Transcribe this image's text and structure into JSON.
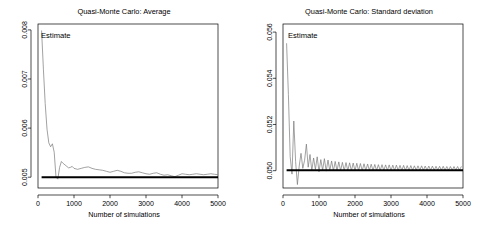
{
  "figure": {
    "background": "#ffffff",
    "series_color": "#7a7a7a",
    "reference_color": "#000000"
  },
  "panels": [
    {
      "key": "average",
      "title": "Quasi-Monte Carlo: Average",
      "annotation": "Estimate",
      "xlabel": "Number of simulations",
      "ylabel": "",
      "xticks": [
        "0",
        "1000",
        "2000",
        "3000",
        "4000",
        "5000"
      ],
      "yticks": [
        "0.005",
        "0.006",
        "0.007",
        "0.008"
      ]
    },
    {
      "key": "stdev",
      "title": "Quasi-Monte Carlo: Standard deviation",
      "annotation": "Estimate",
      "xlabel": "Number of simulations",
      "ylabel": "",
      "xticks": [
        "0",
        "1000",
        "2000",
        "3000",
        "4000",
        "5000"
      ],
      "yticks": [
        "0.050",
        "0.052",
        "0.054",
        "0.056"
      ]
    }
  ],
  "chart_data": [
    {
      "type": "line",
      "title": "Quasi-Monte Carlo: Average",
      "xlabel": "Number of simulations",
      "ylabel": "",
      "xlim": [
        0,
        5000
      ],
      "ylim": [
        0.00478,
        0.00812
      ],
      "xticks": [
        0,
        1000,
        2000,
        3000,
        4000,
        5000
      ],
      "yticks": [
        0.005,
        0.006,
        0.007,
        0.008
      ],
      "grid": false,
      "legend": false,
      "annotations": [
        {
          "text": "Estimate",
          "x": 180,
          "y": 0.00795,
          "color": "#000000"
        }
      ],
      "series": [
        {
          "name": "Estimate",
          "color": "#7a7a7a",
          "width": 0.7,
          "x": [
            100,
            150,
            200,
            250,
            300,
            350,
            400,
            450,
            500,
            550,
            600,
            650,
            700,
            750,
            800,
            850,
            900,
            950,
            1000,
            1100,
            1200,
            1300,
            1400,
            1500,
            1600,
            1700,
            1800,
            1900,
            2000,
            2100,
            2200,
            2300,
            2400,
            2500,
            2600,
            2700,
            2800,
            2900,
            3000,
            3100,
            3200,
            3300,
            3400,
            3500,
            3600,
            3700,
            3800,
            3900,
            4000,
            4100,
            4200,
            4300,
            4400,
            4500,
            4600,
            4700,
            4800,
            4900,
            5000
          ],
          "y": [
            0.00798,
            0.0072,
            0.0065,
            0.00598,
            0.0057,
            0.00562,
            0.00568,
            0.00551,
            0.005,
            0.00496,
            0.0052,
            0.00532,
            0.00528,
            0.00525,
            0.00522,
            0.00519,
            0.0052,
            0.00522,
            0.00518,
            0.00516,
            0.00518,
            0.0052,
            0.00521,
            0.00518,
            0.00516,
            0.00515,
            0.00514,
            0.00512,
            0.0051,
            0.00512,
            0.00514,
            0.00512,
            0.00509,
            0.00508,
            0.00508,
            0.0051,
            0.00511,
            0.00509,
            0.00507,
            0.00506,
            0.00508,
            0.00509,
            0.00506,
            0.00504,
            0.00505,
            0.00503,
            0.00501,
            0.00504,
            0.00507,
            0.00506,
            0.00505,
            0.00506,
            0.00507,
            0.00506,
            0.00505,
            0.00506,
            0.00507,
            0.00506,
            0.00505
          ]
        },
        {
          "name": "Reference",
          "color": "#000000",
          "width": 2.1,
          "x": [
            100,
            5000
          ],
          "y": [
            0.005,
            0.005
          ]
        }
      ]
    },
    {
      "type": "line",
      "title": "Quasi-Monte Carlo: Standard deviation",
      "xlabel": "Number of simulations",
      "ylabel": "",
      "xlim": [
        0,
        5000
      ],
      "ylim": [
        0.04925,
        0.05635
      ],
      "xticks": [
        0,
        1000,
        2000,
        3000,
        4000,
        5000
      ],
      "yticks": [
        0.05,
        0.052,
        0.054,
        0.056
      ],
      "grid": false,
      "legend": false,
      "annotations": [
        {
          "text": "Estimate",
          "x": 180,
          "y": 0.05585,
          "color": "#000000"
        }
      ],
      "series": [
        {
          "name": "Estimate",
          "color": "#7a7a7a",
          "width": 0.7,
          "x": [
            100,
            150,
            200,
            250,
            300,
            350,
            400,
            450,
            500,
            550,
            600,
            650,
            700,
            750,
            800,
            850,
            900,
            950,
            1000,
            1050,
            1100,
            1150,
            1200,
            1250,
            1300,
            1350,
            1400,
            1450,
            1500,
            1550,
            1600,
            1650,
            1700,
            1750,
            1800,
            1850,
            1900,
            1950,
            2000,
            2050,
            2100,
            2150,
            2200,
            2250,
            2300,
            2350,
            2400,
            2450,
            2500,
            2550,
            2600,
            2650,
            2700,
            2750,
            2800,
            2850,
            2900,
            2950,
            3000,
            3050,
            3100,
            3150,
            3200,
            3250,
            3300,
            3350,
            3400,
            3450,
            3500,
            3550,
            3600,
            3650,
            3700,
            3750,
            3800,
            3850,
            3900,
            3950,
            4000,
            4050,
            4100,
            4150,
            4200,
            4250,
            4300,
            4350,
            4400,
            4450,
            4500,
            4550,
            4600,
            4650,
            4700,
            4750,
            4800,
            4850,
            4900,
            4950
          ],
          "y": [
            0.0555,
            0.0533,
            0.0506,
            0.04985,
            0.05215,
            0.0504,
            0.0494,
            0.0502,
            0.05075,
            0.0501,
            0.05045,
            0.05115,
            0.05015,
            0.0507,
            0.05,
            0.05055,
            0.05005,
            0.0506,
            0.04995,
            0.05048,
            0.05002,
            0.05052,
            0.04998,
            0.05046,
            0.05,
            0.05042,
            0.04999,
            0.0504,
            0.05,
            0.05038,
            0.05,
            0.05036,
            0.05,
            0.05035,
            0.05,
            0.05034,
            0.05,
            0.05033,
            0.05,
            0.05032,
            0.05,
            0.05031,
            0.05,
            0.0503,
            0.05001,
            0.05029,
            0.05001,
            0.05028,
            0.05001,
            0.05027,
            0.05001,
            0.05026,
            0.05001,
            0.05026,
            0.05001,
            0.05025,
            0.05001,
            0.05025,
            0.05001,
            0.05024,
            0.05001,
            0.05024,
            0.05001,
            0.05023,
            0.05001,
            0.05023,
            0.05001,
            0.05022,
            0.05001,
            0.05022,
            0.05002,
            0.05021,
            0.05002,
            0.05021,
            0.05002,
            0.05021,
            0.05002,
            0.0502,
            0.05002,
            0.0502,
            0.05002,
            0.0502,
            0.05002,
            0.05019,
            0.05002,
            0.05019,
            0.05002,
            0.05019,
            0.05002,
            0.05018,
            0.05002,
            0.05018,
            0.05002,
            0.05018,
            0.05002,
            0.05018,
            0.05002,
            0.05017
          ]
        },
        {
          "name": "Reference",
          "color": "#000000",
          "width": 2.1,
          "x": [
            100,
            5000
          ],
          "y": [
            0.05002,
            0.05002
          ]
        }
      ]
    }
  ]
}
